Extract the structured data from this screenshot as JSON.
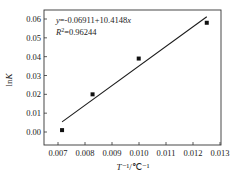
{
  "chart_data": {
    "type": "scatter",
    "title": "",
    "xlabel": "T⁻¹/℃⁻¹",
    "ylabel": "lnK",
    "xlim": [
      0.0065,
      0.013
    ],
    "ylim": [
      -0.007,
      0.064
    ],
    "x_ticks": [
      0.007,
      0.008,
      0.009,
      0.01,
      0.011,
      0.012,
      0.013
    ],
    "x_tick_labels": [
      "0.007",
      "0.008",
      "0.009",
      "0.010",
      "0.011",
      "0.012",
      "0.013"
    ],
    "y_ticks": [
      0.0,
      0.01,
      0.02,
      0.03,
      0.04,
      0.05,
      0.06
    ],
    "y_tick_labels": [
      "0.00",
      "0.01",
      "0.02",
      "0.03",
      "0.04",
      "0.05",
      "0.06"
    ],
    "grid": false,
    "legend": null,
    "series": [
      {
        "name": "data",
        "marker": "square",
        "x": [
          0.00715,
          0.00828,
          0.00999,
          0.01251
        ],
        "y": [
          0.001,
          0.02,
          0.039,
          0.058
        ]
      },
      {
        "name": "linear fit",
        "type": "line",
        "intercept": -0.06911,
        "slope": 10.4148,
        "x_range": [
          0.00715,
          0.01251
        ]
      }
    ],
    "annotations": [
      "y=-0.06911+10.4148x",
      "R²=0.96244"
    ]
  },
  "labels": {
    "ylabel_main": "ln",
    "ylabel_italic": "K",
    "xlabel_T": "T",
    "xlabel_rest": "⁻¹/℃⁻¹",
    "eq_y": "y",
    "eq_rest": "=-0.06911+10.4148",
    "eq_x": "x",
    "r2_R": "R",
    "r2_sup": "2",
    "r2_rest": "=0.96244"
  }
}
